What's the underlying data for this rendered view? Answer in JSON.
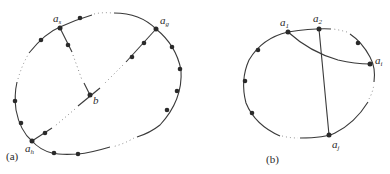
{
  "figure_a": {
    "caption": "(a)",
    "labels": {
      "as": {
        "base": "a",
        "sub": "s"
      },
      "ag": {
        "base": "a",
        "sub": "g"
      },
      "ah": {
        "base": "a",
        "sub": "h"
      },
      "b": {
        "base": "b"
      }
    }
  },
  "figure_b": {
    "caption": "(b)",
    "labels": {
      "a1": {
        "base": "a",
        "sub": "1"
      },
      "a2": {
        "base": "a",
        "sub": "2"
      },
      "ai": {
        "base": "a",
        "sub": "i"
      },
      "aj": {
        "base": "a",
        "sub": "j"
      }
    }
  },
  "colors": {
    "stroke": "#3a3a3a",
    "vertex": "#2a2a2a",
    "background": "#ffffff"
  }
}
